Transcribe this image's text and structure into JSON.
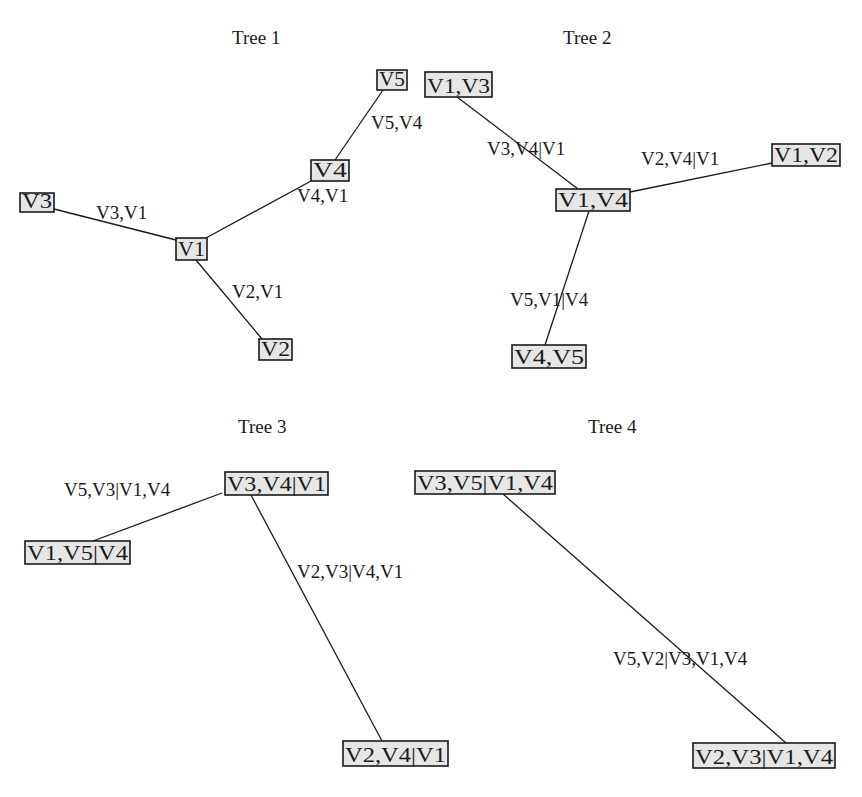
{
  "figure": {
    "width": 862,
    "height": 797,
    "node_fill": "#e6e6e6",
    "line_color": "#1a1a1a"
  },
  "trees": [
    {
      "title": "Tree 1",
      "title_pos": [
        232,
        44
      ],
      "nodes": [
        {
          "id": "V5",
          "label": "V5",
          "box": [
            377,
            70,
            30,
            20
          ]
        },
        {
          "id": "V4",
          "label": "V4",
          "box": [
            311,
            160,
            38,
            21
          ]
        },
        {
          "id": "V3",
          "label": "V3",
          "box": [
            20,
            193,
            34,
            19
          ]
        },
        {
          "id": "V1",
          "label": "V1",
          "box": [
            176,
            238,
            31,
            22
          ]
        },
        {
          "id": "V2",
          "label": "V2",
          "box": [
            259,
            339,
            33,
            21
          ]
        }
      ],
      "edges": [
        {
          "from": "V5",
          "to": "V4",
          "label": "V5,V4",
          "line": [
            383,
            90,
            335,
            160
          ],
          "label_pos": [
            371,
            129
          ]
        },
        {
          "from": "V4",
          "to": "V1",
          "label": "V4,V1",
          "line": [
            311,
            181,
            206,
            238
          ],
          "label_pos": [
            297,
            202
          ]
        },
        {
          "from": "V3",
          "to": "V1",
          "label": "V3,V1",
          "line": [
            54,
            209,
            176,
            240
          ],
          "label_pos": [
            96,
            219
          ]
        },
        {
          "from": "V1",
          "to": "V2",
          "label": "V2,V1",
          "line": [
            196,
            260,
            262,
            339
          ],
          "label_pos": [
            232,
            298
          ]
        }
      ]
    },
    {
      "title": "Tree 2",
      "title_pos": [
        563,
        44
      ],
      "nodes": [
        {
          "id": "V1V3",
          "label": "V1,V3",
          "box": [
            425,
            72,
            67,
            25
          ]
        },
        {
          "id": "V1V4",
          "label": "V1,V4",
          "box": [
            556,
            189,
            74,
            22
          ]
        },
        {
          "id": "V1V2",
          "label": "V1,V2",
          "box": [
            772,
            144,
            68,
            22
          ]
        },
        {
          "id": "V4V5",
          "label": "V4,V5",
          "box": [
            512,
            345,
            74,
            23
          ]
        }
      ],
      "edges": [
        {
          "from": "V1V3",
          "to": "V1V4",
          "label": "V3,V4|V1",
          "line": [
            457,
            97,
            578,
            189
          ],
          "label_pos": [
            487,
            155
          ]
        },
        {
          "from": "V1V4",
          "to": "V1V2",
          "label": "V2,V4|V1",
          "line": [
            630,
            192,
            772,
            163
          ],
          "label_pos": [
            641,
            165
          ]
        },
        {
          "from": "V1V4",
          "to": "V4V5",
          "label": "V5,V1|V4",
          "line": [
            589,
            211,
            545,
            345
          ],
          "label_pos": [
            510,
            306
          ]
        }
      ]
    },
    {
      "title": "Tree 3",
      "title_pos": [
        238,
        433
      ],
      "nodes": [
        {
          "id": "V3V4_V1",
          "label": "V3,V4|V1",
          "box": [
            225,
            472,
            103,
            23
          ]
        },
        {
          "id": "V1V5_V4",
          "label": "V1,V5|V4",
          "box": [
            25,
            541,
            105,
            23
          ]
        },
        {
          "id": "V2V4_V1",
          "label": "V2,V4|V1",
          "box": [
            343,
            741,
            105,
            25
          ]
        }
      ],
      "edges": [
        {
          "from": "V3V4_V1",
          "to": "V1V5_V4",
          "label": "V5,V3|V1,V4",
          "line": [
            222,
            493,
            93,
            541
          ],
          "label_pos": [
            64,
            496
          ]
        },
        {
          "from": "V3V4_V1",
          "to": "V2V4_V1",
          "label": "V2,V3|V4,V1",
          "line": [
            251,
            495,
            382,
            741
          ],
          "label_pos": [
            297,
            578
          ]
        }
      ]
    },
    {
      "title": "Tree 4",
      "title_pos": [
        588,
        433
      ],
      "nodes": [
        {
          "id": "V3V5_V1V4",
          "label": "V3,V5|V1,V4",
          "box": [
            415,
            471,
            140,
            23
          ]
        },
        {
          "id": "V2V3_V1V4",
          "label": "V2,V3|V1,V4",
          "box": [
            693,
            743,
            142,
            25
          ]
        }
      ],
      "edges": [
        {
          "from": "V3V5_V1V4",
          "to": "V2V3_V1V4",
          "label": "V5,V2|V3,V1,V4",
          "line": [
            503,
            494,
            786,
            743
          ],
          "label_pos": [
            613,
            665
          ]
        }
      ]
    }
  ]
}
